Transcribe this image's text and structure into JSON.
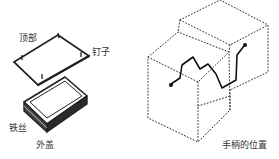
{
  "left_figure": {
    "labels": {
      "top": "顶部",
      "nail": "钉子",
      "wire": "铁丝",
      "cover": "外盖"
    }
  },
  "right_figure": {
    "labels": {
      "handle_position": "手柄的位置"
    }
  },
  "colors": {
    "ink": "#222222",
    "text": "#333333",
    "background": "#ffffff"
  }
}
